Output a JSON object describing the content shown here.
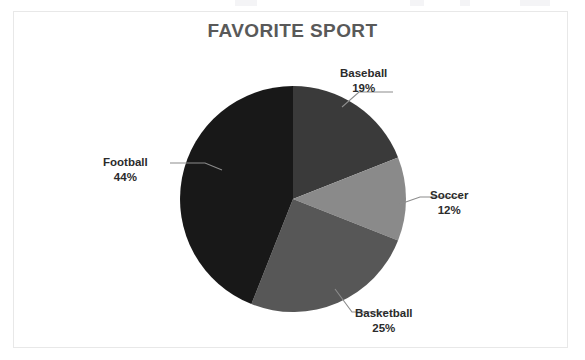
{
  "chart": {
    "title": "FAVORITE SPORT",
    "frame_color": "#e8e8e8",
    "title_color": "#595959",
    "label_color": "#2b2b2b",
    "leader_line_color": "#8c8c8c",
    "background": "#ffffff"
  },
  "labels": {
    "baseball": {
      "name": "Baseball",
      "pct": "19%"
    },
    "soccer": {
      "name": "Soccer",
      "pct": "12%"
    },
    "basketball": {
      "name": "Basketball",
      "pct": "25%"
    },
    "football": {
      "name": "Football",
      "pct": "44%"
    }
  },
  "chart_data": {
    "type": "pie",
    "title": "FAVORITE SPORT",
    "xlabel": "",
    "ylabel": "",
    "legend_position": "none",
    "labels_position": "outside-with-leader-lines",
    "grid": false,
    "start_angle_deg": 0,
    "direction": "clockwise",
    "center": [
      293,
      199
    ],
    "radius": 113,
    "categories": [
      "Baseball",
      "Soccer",
      "Basketball",
      "Football"
    ],
    "values": [
      19,
      12,
      25,
      44
    ],
    "value_labels": [
      "19%",
      "12%",
      "25%",
      "44%"
    ],
    "colors": [
      "#3a3a3a",
      "#8a8a8a",
      "#575757",
      "#181818"
    ],
    "total": 100,
    "units": "percent"
  }
}
